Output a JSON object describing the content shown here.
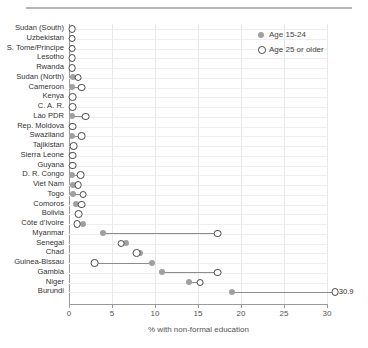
{
  "chart_data": {
    "type": "scatter",
    "title": "",
    "xlabel": "% with non-formal education",
    "ylabel": "",
    "xlim": [
      0,
      30
    ],
    "xticks": [
      0,
      5,
      10,
      15,
      20,
      25,
      30
    ],
    "grid": true,
    "legend_position": "top-right",
    "legend": [
      "Age 15-24",
      "Age 25 or older"
    ],
    "categories": [
      "Sudan (South)",
      "Uzbekistan",
      "S. Tome/Principe",
      "Lesotho",
      "Rwanda",
      "Sudan (North)",
      "Cameroon",
      "Kenya",
      "C. A. R.",
      "Lao PDR",
      "Rep. Moldova",
      "Swaziland",
      "Tajikistan",
      "Sierra Leone",
      "Guyana",
      "D. R. Congo",
      "Viet Nam",
      "Togo",
      "Comoros",
      "Bolivia",
      "Côte d’Ivoire",
      "Myanmar",
      "Senegal",
      "Chad",
      "Guinea-Bissau",
      "Gambia",
      "Niger",
      "Burundi"
    ],
    "series": [
      {
        "name": "Age 15-24",
        "marker": "filled-circle",
        "color": "#a0a0a0",
        "values": [
          0.3,
          0.3,
          0.3,
          0.3,
          0.3,
          0.5,
          0.3,
          0.4,
          0.4,
          0.4,
          0.4,
          0.4,
          0.5,
          0.4,
          0.4,
          0.4,
          0.5,
          0.5,
          0.8,
          1.1,
          1.6,
          4.0,
          6.6,
          8.2,
          9.7,
          10.8,
          14.0,
          19.0
        ]
      },
      {
        "name": "Age 25 or older",
        "marker": "open-circle",
        "color": "#4a4a4a",
        "values": [
          0.3,
          0.3,
          0.3,
          0.3,
          0.3,
          1.0,
          1.4,
          0.4,
          0.4,
          1.9,
          0.4,
          1.4,
          0.5,
          0.4,
          0.4,
          1.3,
          1.0,
          1.6,
          1.4,
          1.1,
          0.9,
          17.2,
          6.0,
          7.8,
          2.9,
          17.2,
          15.2,
          30.9
        ]
      }
    ],
    "point_labels": [
      {
        "category": "Burundi",
        "series": "Age 25 or older",
        "text": "30.9"
      }
    ]
  }
}
